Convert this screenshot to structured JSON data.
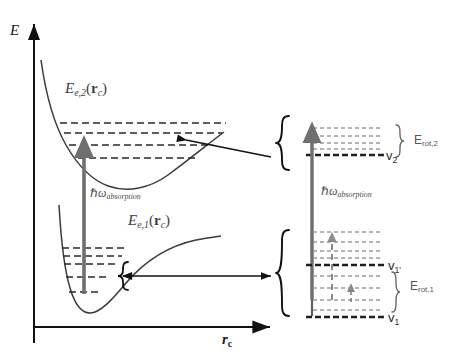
{
  "figure": {
    "background_color": "#ffffff",
    "width": 457,
    "height": 363
  },
  "axes": {
    "y_axis_label": "E",
    "x_axis_label_main": "r",
    "x_axis_label_sub": "c",
    "y_axis_name": "energy-axis",
    "x_axis_name": "internuclear-coordinate-axis"
  },
  "left_panel": {
    "upper_curve": {
      "label_main": "E",
      "label_sub_state": "e,2",
      "label_arg_open": "(",
      "label_arg_bold": "r",
      "label_arg_sub": "c",
      "label_arg_close": ")",
      "level_count": 4
    },
    "lower_curve": {
      "label_main": "E",
      "label_sub_state": "e,1",
      "label_arg_open": "(",
      "label_arg_bold": "r",
      "label_arg_sub": "c",
      "label_arg_close": ")",
      "level_count": 5
    },
    "transition": {
      "label_hbar": "ℏ",
      "label_omega": "ω",
      "label_sub": "absorption",
      "color": "#6f6f6f"
    }
  },
  "right_panel": {
    "transition": {
      "label_hbar": "ℏ",
      "label_omega": "ω",
      "label_sub": "absorption",
      "color": "#6f6f6f"
    },
    "upper_manifold": {
      "vib_label_main": "v",
      "vib_label_sub": "2",
      "rot_label_main": "E",
      "rot_label_sub": "rot,2",
      "rot_line_count": 4
    },
    "lower_manifold": {
      "vib_label_upper_main": "v",
      "vib_label_upper_sub": "1'",
      "vib_label_lower_main": "v",
      "vib_label_lower_sub": "1",
      "rot_label_main": "E",
      "rot_label_sub": "rot,1",
      "rot_line_count_upper": 5,
      "rot_line_count_lower": 5
    }
  },
  "colors": {
    "curve_stroke": "#3a3a3a",
    "level_dash": "#2a2a2a",
    "axis": "#111111",
    "arrow_gray": "#707070",
    "rot_line_light": "#9a9a9a",
    "brace": "#111111",
    "text_dark": "#333333"
  }
}
